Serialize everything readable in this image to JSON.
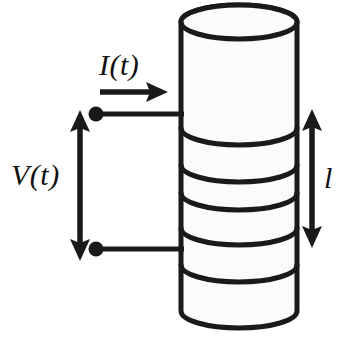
{
  "figure": {
    "type": "schematic-diagram",
    "background_color": "#ffffff",
    "stroke_color": "#1a1a1a",
    "fill_color": "#fbfbfb"
  },
  "labels": {
    "current": "I(t)",
    "voltage": "V(t)",
    "length": "l"
  },
  "annotations": {
    "current_arrow": {
      "name": "current-direction-arrow",
      "direction": "right",
      "x_start": 100,
      "x_end": 166,
      "y": 92
    },
    "voltage_arrow": {
      "name": "voltage-span-arrow",
      "direction": "double-vertical",
      "x": 80,
      "y_start": 112,
      "y_end": 259
    },
    "length_arrow": {
      "name": "length-span-arrow",
      "direction": "double-vertical",
      "x": 312,
      "y_start": 111,
      "y_end": 246
    }
  },
  "cylinder": {
    "name": "sample-cylinder",
    "left": 181,
    "right": 297,
    "top_center_y": 22,
    "bottom_center_y": 311,
    "ellipse_ry": 17,
    "band_y_positions": [
      128,
      165,
      193,
      228,
      265
    ],
    "band_count": 5
  },
  "electrodes": [
    {
      "name": "top-electrode-terminal",
      "x": 96,
      "y": 114,
      "radius": 7
    },
    {
      "name": "bottom-electrode-terminal",
      "x": 96,
      "y": 249,
      "radius": 7
    }
  ],
  "leads": [
    {
      "name": "top-lead-wire",
      "x_start": 96,
      "x_end": 182,
      "y": 114
    },
    {
      "name": "bottom-lead-wire",
      "x_start": 96,
      "x_end": 182,
      "y": 249
    }
  ],
  "colors": {
    "stroke": "#1a1a1a",
    "fill": "#fbfbfb",
    "background": "#ffffff"
  }
}
